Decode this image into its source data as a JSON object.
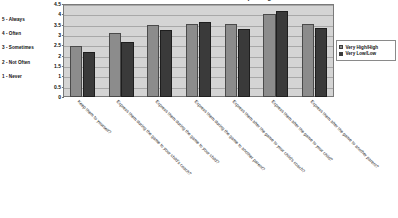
{
  "chart_data": {
    "type": "bar",
    "title": "Parent Behaviour at Youth Sporting Events",
    "xlabel": "",
    "ylabel": "",
    "ylim": [
      0,
      4.5
    ],
    "ytick_values": [
      0,
      0.5,
      1,
      1.5,
      2,
      2.5,
      3,
      3.5,
      4,
      4.5
    ],
    "ytick_labels": [
      "0",
      "0.5",
      "1",
      "1.5",
      "2",
      "2.5",
      "3",
      "3.5",
      "4",
      "4.5"
    ],
    "grid": true,
    "legend_position": "right",
    "categories": [
      "Keep them to yourself?",
      "Express them during the game to your child's coach?",
      "Express them during the game to your child?",
      "Express them during the game to another parent?",
      "Express them after the game to your child's coach?",
      "Express them after the game to your child?",
      "Express them after the game to another parent?"
    ],
    "series": [
      {
        "name": "Very High/High",
        "color": "#8c8c8c",
        "values": [
          2.45,
          3.12,
          3.5,
          3.55,
          3.55,
          4.02,
          3.52
        ]
      },
      {
        "name": "Very Low/Low",
        "color": "#3a3a3a",
        "values": [
          2.19,
          2.65,
          3.25,
          3.62,
          3.28,
          4.17,
          3.35
        ]
      }
    ],
    "scale_key": [
      "5 - Always",
      "4 - Often",
      "3 - Sometimes",
      "2 - Not Often",
      "1 - Never"
    ]
  }
}
